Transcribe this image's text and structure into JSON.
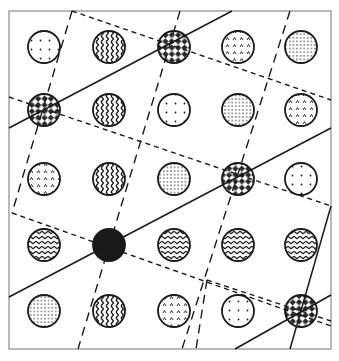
{
  "figure": {
    "frame": {
      "x": 9,
      "y": 11,
      "width": 322,
      "height": 338
    },
    "circle_radius": 16,
    "colors": {
      "ink": "#1a1a1a",
      "frame": "#8a8a8a",
      "background": "#ffffff"
    },
    "columns_x": [
      44,
      109,
      174,
      238,
      301
    ],
    "rows_y": [
      47,
      110,
      179,
      245,
      311
    ],
    "grid": [
      [
        "sparse-dots",
        "vertical-zigzag",
        "checkered",
        "triangles",
        "dense-dots"
      ],
      [
        "checkered",
        "vertical-zigzag",
        "sparse-dots",
        "dense-dots",
        "triangles"
      ],
      [
        "triangles",
        "vertical-zigzag",
        "dense-dots",
        "checkered",
        "sparse-dots"
      ],
      [
        "horizontal-zigzag",
        "solid-black",
        "horizontal-zigzag",
        "horizontal-zigzag",
        "horizontal-zigzag"
      ],
      [
        "dense-dots",
        "vertical-zigzag",
        "triangles",
        "sparse-dots",
        "checkered"
      ]
    ],
    "solid_lines": [
      [
        [
          9,
          128
        ],
        [
          232,
          11
        ]
      ],
      [
        [
          9,
          297
        ],
        [
          331,
          128
        ]
      ],
      [
        [
          235,
          349
        ],
        [
          331,
          295
        ]
      ],
      [
        [
          331,
          206
        ],
        [
          290,
          349
        ]
      ]
    ],
    "short_dashed_lines": [
      [
        [
          72,
          11
        ],
        [
          331,
          100
        ]
      ],
      [
        [
          9,
          97
        ],
        [
          331,
          206
        ]
      ],
      [
        [
          12,
          213
        ],
        [
          331,
          326
        ]
      ],
      [
        [
          207,
          280
        ],
        [
          331,
          321
        ]
      ]
    ],
    "long_dashed_lines": [
      [
        [
          72,
          11
        ],
        [
          12,
          213
        ]
      ],
      [
        [
          180,
          11
        ],
        [
          78,
          349
        ]
      ],
      [
        [
          290,
          11
        ],
        [
          182,
          349
        ]
      ],
      [
        [
          207,
          280
        ],
        [
          196,
          349
        ]
      ]
    ]
  }
}
